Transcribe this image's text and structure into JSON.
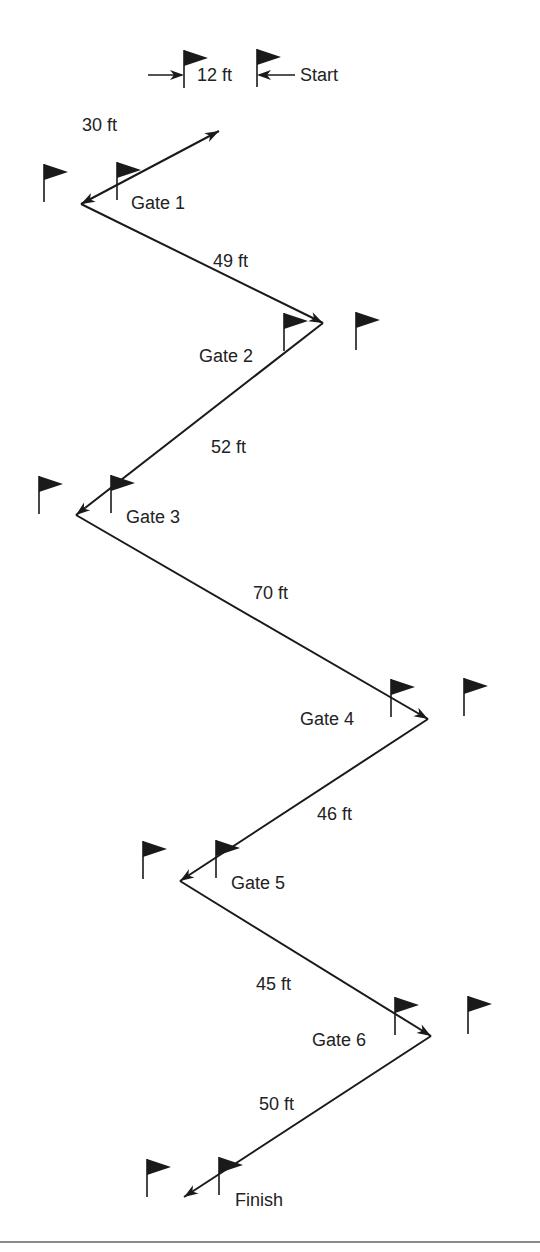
{
  "diagram": {
    "type": "slalom-course",
    "colors": {
      "ink": "#1a1a1a",
      "text": "#222222",
      "rule": "#8a8a8a"
    },
    "start": {
      "label": "Start",
      "gate_width_label": "12 ft",
      "x": 300,
      "y": 75
    },
    "points": [
      {
        "id": "start",
        "x": 219,
        "y": 131
      },
      {
        "id": "gate1",
        "x": 81,
        "y": 204
      },
      {
        "id": "gate2",
        "x": 323,
        "y": 323
      },
      {
        "id": "gate3",
        "x": 76,
        "y": 515
      },
      {
        "id": "gate4",
        "x": 428,
        "y": 719
      },
      {
        "id": "gate5",
        "x": 180,
        "y": 881
      },
      {
        "id": "gate6",
        "x": 431,
        "y": 1036
      },
      {
        "id": "finish",
        "x": 184,
        "y": 1197
      }
    ],
    "segments": [
      {
        "from": 0,
        "to": 1,
        "label": "30 ft",
        "lx": 82,
        "ly": 116
      },
      {
        "from": 1,
        "to": 2,
        "label": "49 ft",
        "lx": 213,
        "ly": 252
      },
      {
        "from": 2,
        "to": 3,
        "label": "52 ft",
        "lx": 211,
        "ly": 438
      },
      {
        "from": 3,
        "to": 4,
        "label": "70 ft",
        "lx": 253,
        "ly": 584
      },
      {
        "from": 4,
        "to": 5,
        "label": "46 ft",
        "lx": 317,
        "ly": 805
      },
      {
        "from": 5,
        "to": 6,
        "label": "45 ft",
        "lx": 256,
        "ly": 975
      },
      {
        "from": 6,
        "to": 7,
        "label": "50 ft",
        "lx": 259,
        "ly": 1095
      }
    ],
    "gates": [
      {
        "label": "Gate 1",
        "lx": 131,
        "ly": 194,
        "flags": [
          [
            44,
            164
          ],
          [
            117,
            162
          ]
        ]
      },
      {
        "label": "Gate 2",
        "lx": 199,
        "ly": 347,
        "flags": [
          [
            284,
            313
          ],
          [
            356,
            312
          ]
        ]
      },
      {
        "label": "Gate 3",
        "lx": 126,
        "ly": 508,
        "flags": [
          [
            39,
            476
          ],
          [
            111,
            475
          ]
        ]
      },
      {
        "label": "Gate 4",
        "lx": 300,
        "ly": 710,
        "flags": [
          [
            391,
            679
          ],
          [
            464,
            678
          ]
        ]
      },
      {
        "label": "Gate 5",
        "lx": 231,
        "ly": 874,
        "flags": [
          [
            143,
            841
          ],
          [
            216,
            840
          ]
        ]
      },
      {
        "label": "Gate 6",
        "lx": 312,
        "ly": 1031,
        "flags": [
          [
            395,
            997
          ],
          [
            468,
            996
          ]
        ]
      },
      {
        "label": "Finish",
        "lx": 235,
        "ly": 1191,
        "flags": [
          [
            147,
            1159
          ],
          [
            219,
            1157
          ]
        ]
      }
    ],
    "start_flags": [
      [
        184,
        50
      ],
      [
        257,
        49
      ]
    ]
  }
}
